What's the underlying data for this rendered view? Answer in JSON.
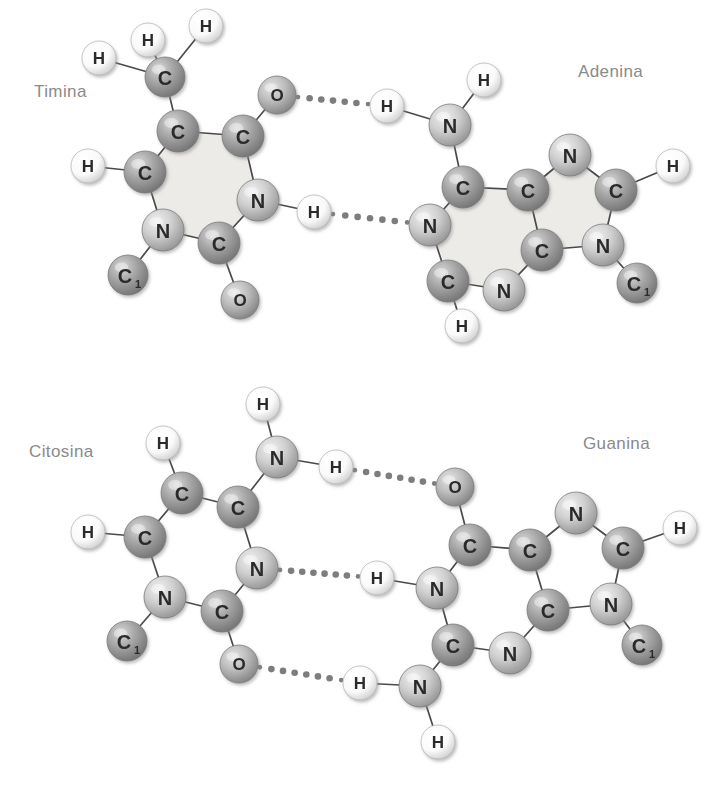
{
  "figure": {
    "title_present": false,
    "background_color": "#ffffff",
    "label_color": "#8a8a8a",
    "atom_text_color": "#2b2b2b",
    "colors": {
      "carbon_fill": "#9e9e9e",
      "nitrogen_fill": "#c9c9c9",
      "oxygen_fill": "#b4b4b4",
      "hydrogen_fill": "#fbfbfb",
      "ring_shade": "#eceae6",
      "bond_stroke": "#4a4a4a",
      "hbond_dot": "#7d7d7d"
    }
  },
  "labels": [
    {
      "id": "timina",
      "text": "Timina",
      "x": 34,
      "y": 90
    },
    {
      "id": "adenina",
      "text": "Adenina",
      "x": 578,
      "y": 70
    },
    {
      "id": "citosina",
      "text": "Citosina",
      "x": 29,
      "y": 450
    },
    {
      "id": "guanina",
      "text": "Guanina",
      "x": 583,
      "y": 442
    }
  ],
  "pairs": [
    {
      "id": "AT",
      "left_base": "Timina",
      "right_base": "Adenina",
      "hydrogen_bonds": 2
    },
    {
      "id": "CG",
      "left_base": "Citosina",
      "right_base": "Guanina",
      "hydrogen_bonds": 3
    }
  ],
  "rings": [
    {
      "id": "thymine-ring",
      "points": "178,131 243,136 258,200 219,243 163,230 145,172"
    },
    {
      "id": "adenine-ring6",
      "points": "463,187 528,190 542,250 505,290 450,279 430,225"
    },
    {
      "id": "adenine-ring5",
      "points": "528,190 570,155 615,190 603,245 542,250"
    }
  ],
  "atoms": [
    {
      "id": "t-ch3-h-left",
      "el": "H",
      "x": 99,
      "y": 58,
      "r": 17
    },
    {
      "id": "t-ch3-h-mid",
      "el": "H",
      "x": 148,
      "y": 40,
      "r": 17
    },
    {
      "id": "t-ch3-h-right",
      "el": "H",
      "x": 206,
      "y": 26,
      "r": 17
    },
    {
      "id": "t-ch3-c",
      "el": "C",
      "x": 165,
      "y": 77,
      "r": 20
    },
    {
      "id": "t-c5",
      "el": "C",
      "x": 178,
      "y": 131,
      "r": 21
    },
    {
      "id": "t-c4",
      "el": "C",
      "x": 243,
      "y": 136,
      "r": 21
    },
    {
      "id": "t-o4",
      "el": "O",
      "x": 277,
      "y": 95,
      "r": 19
    },
    {
      "id": "t-n3",
      "el": "N",
      "x": 258,
      "y": 200,
      "r": 21
    },
    {
      "id": "t-n3-h",
      "el": "H",
      "x": 314,
      "y": 212,
      "r": 17
    },
    {
      "id": "t-c2",
      "el": "C",
      "x": 219,
      "y": 243,
      "r": 21
    },
    {
      "id": "t-o2",
      "el": "O",
      "x": 240,
      "y": 300,
      "r": 19
    },
    {
      "id": "t-n1",
      "el": "N",
      "x": 163,
      "y": 230,
      "r": 21
    },
    {
      "id": "t-c1prime",
      "el": "C1",
      "x": 128,
      "y": 275,
      "r": 20
    },
    {
      "id": "t-c6",
      "el": "C",
      "x": 145,
      "y": 172,
      "r": 21
    },
    {
      "id": "t-c6-h",
      "el": "H",
      "x": 88,
      "y": 166,
      "r": 17
    },
    {
      "id": "a-n6",
      "el": "N",
      "x": 450,
      "y": 125,
      "r": 21
    },
    {
      "id": "a-n6-h-up",
      "el": "H",
      "x": 484,
      "y": 80,
      "r": 17
    },
    {
      "id": "a-n6-h-left",
      "el": "H",
      "x": 387,
      "y": 106,
      "r": 17
    },
    {
      "id": "a-c6",
      "el": "C",
      "x": 463,
      "y": 187,
      "r": 21
    },
    {
      "id": "a-n1",
      "el": "N",
      "x": 430,
      "y": 225,
      "r": 21
    },
    {
      "id": "a-c2",
      "el": "C",
      "x": 448,
      "y": 281,
      "r": 21
    },
    {
      "id": "a-c2-h",
      "el": "H",
      "x": 462,
      "y": 326,
      "r": 17
    },
    {
      "id": "a-n3",
      "el": "N",
      "x": 504,
      "y": 290,
      "r": 21
    },
    {
      "id": "a-c4",
      "el": "C",
      "x": 542,
      "y": 250,
      "r": 21
    },
    {
      "id": "a-c5",
      "el": "C",
      "x": 528,
      "y": 190,
      "r": 21
    },
    {
      "id": "a-n7",
      "el": "N",
      "x": 570,
      "y": 155,
      "r": 21
    },
    {
      "id": "a-c8",
      "el": "C",
      "x": 616,
      "y": 190,
      "r": 21
    },
    {
      "id": "a-c8-h",
      "el": "H",
      "x": 673,
      "y": 166,
      "r": 17
    },
    {
      "id": "a-n9",
      "el": "N",
      "x": 603,
      "y": 245,
      "r": 21
    },
    {
      "id": "a-c1prime",
      "el": "C1",
      "x": 637,
      "y": 283,
      "r": 20
    },
    {
      "id": "c-n4-h-up",
      "el": "H",
      "x": 263,
      "y": 404,
      "r": 17
    },
    {
      "id": "c-n4",
      "el": "N",
      "x": 277,
      "y": 457,
      "r": 21
    },
    {
      "id": "c-n4-h-right",
      "el": "H",
      "x": 336,
      "y": 467,
      "r": 17
    },
    {
      "id": "c-c5-h",
      "el": "H",
      "x": 163,
      "y": 443,
      "r": 17
    },
    {
      "id": "c-c5",
      "el": "C",
      "x": 182,
      "y": 493,
      "r": 21
    },
    {
      "id": "c-c4",
      "el": "C",
      "x": 238,
      "y": 507,
      "r": 21
    },
    {
      "id": "c-n3",
      "el": "N",
      "x": 257,
      "y": 568,
      "r": 21
    },
    {
      "id": "c-c2",
      "el": "C",
      "x": 222,
      "y": 611,
      "r": 21
    },
    {
      "id": "c-o2",
      "el": "O",
      "x": 239,
      "y": 664,
      "r": 19
    },
    {
      "id": "c-n1",
      "el": "N",
      "x": 165,
      "y": 597,
      "r": 21
    },
    {
      "id": "c-c1prime",
      "el": "C1",
      "x": 127,
      "y": 641,
      "r": 20
    },
    {
      "id": "c-c6",
      "el": "C",
      "x": 145,
      "y": 537,
      "r": 21
    },
    {
      "id": "c-c6-h",
      "el": "H",
      "x": 88,
      "y": 532,
      "r": 17
    },
    {
      "id": "g-o6",
      "el": "O",
      "x": 455,
      "y": 487,
      "r": 19
    },
    {
      "id": "g-c6",
      "el": "C",
      "x": 470,
      "y": 545,
      "r": 21
    },
    {
      "id": "g-n1",
      "el": "N",
      "x": 437,
      "y": 588,
      "r": 21
    },
    {
      "id": "g-n1-h",
      "el": "H",
      "x": 377,
      "y": 578,
      "r": 17
    },
    {
      "id": "g-c2",
      "el": "C",
      "x": 453,
      "y": 645,
      "r": 21
    },
    {
      "id": "g-n2",
      "el": "N",
      "x": 420,
      "y": 686,
      "r": 21
    },
    {
      "id": "g-n2-h-left",
      "el": "H",
      "x": 360,
      "y": 683,
      "r": 17
    },
    {
      "id": "g-n2-h-down",
      "el": "H",
      "x": 438,
      "y": 742,
      "r": 17
    },
    {
      "id": "g-n3",
      "el": "N",
      "x": 510,
      "y": 653,
      "r": 21
    },
    {
      "id": "g-c4",
      "el": "C",
      "x": 548,
      "y": 610,
      "r": 21
    },
    {
      "id": "g-c5",
      "el": "C",
      "x": 530,
      "y": 550,
      "r": 21
    },
    {
      "id": "g-n7",
      "el": "N",
      "x": 576,
      "y": 513,
      "r": 21
    },
    {
      "id": "g-c8",
      "el": "C",
      "x": 623,
      "y": 548,
      "r": 21
    },
    {
      "id": "g-c8-h",
      "el": "H",
      "x": 680,
      "y": 528,
      "r": 17
    },
    {
      "id": "g-n9",
      "el": "N",
      "x": 611,
      "y": 604,
      "r": 21
    },
    {
      "id": "g-c1prime",
      "el": "C1",
      "x": 642,
      "y": 645,
      "r": 20
    }
  ],
  "bonds": [
    [
      "t-ch3-h-left",
      "t-ch3-c"
    ],
    [
      "t-ch3-h-mid",
      "t-ch3-c"
    ],
    [
      "t-ch3-h-right",
      "t-ch3-c"
    ],
    [
      "t-ch3-c",
      "t-c5"
    ],
    [
      "t-c5",
      "t-c4"
    ],
    [
      "t-c4",
      "t-o4"
    ],
    [
      "t-c4",
      "t-n3"
    ],
    [
      "t-n3",
      "t-n3-h"
    ],
    [
      "t-n3",
      "t-c2"
    ],
    [
      "t-c2",
      "t-o2"
    ],
    [
      "t-c2",
      "t-n1"
    ],
    [
      "t-n1",
      "t-c1prime"
    ],
    [
      "t-n1",
      "t-c6"
    ],
    [
      "t-c6",
      "t-c5"
    ],
    [
      "t-c6",
      "t-c6-h"
    ],
    [
      "a-n6-h-up",
      "a-n6"
    ],
    [
      "a-n6-h-left",
      "a-n6"
    ],
    [
      "a-n6",
      "a-c6"
    ],
    [
      "a-c6",
      "a-n1"
    ],
    [
      "a-n1",
      "a-c2"
    ],
    [
      "a-c2",
      "a-c2-h"
    ],
    [
      "a-c2",
      "a-n3"
    ],
    [
      "a-n3",
      "a-c4"
    ],
    [
      "a-c4",
      "a-c5"
    ],
    [
      "a-c5",
      "a-c6"
    ],
    [
      "a-c5",
      "a-n7"
    ],
    [
      "a-n7",
      "a-c8"
    ],
    [
      "a-c8",
      "a-c8-h"
    ],
    [
      "a-c8",
      "a-n9"
    ],
    [
      "a-n9",
      "a-c4"
    ],
    [
      "a-n9",
      "a-c1prime"
    ],
    [
      "c-n4-h-up",
      "c-n4"
    ],
    [
      "c-n4",
      "c-n4-h-right"
    ],
    [
      "c-n4",
      "c-c4"
    ],
    [
      "c-c5-h",
      "c-c5"
    ],
    [
      "c-c5",
      "c-c4"
    ],
    [
      "c-c4",
      "c-n3"
    ],
    [
      "c-n3",
      "c-c2"
    ],
    [
      "c-c2",
      "c-o2"
    ],
    [
      "c-c2",
      "c-n1"
    ],
    [
      "c-n1",
      "c-c1prime"
    ],
    [
      "c-n1",
      "c-c6"
    ],
    [
      "c-c6",
      "c-c5"
    ],
    [
      "c-c6",
      "c-c6-h"
    ],
    [
      "g-o6",
      "g-c6"
    ],
    [
      "g-c6",
      "g-n1"
    ],
    [
      "g-n1",
      "g-n1-h"
    ],
    [
      "g-n1",
      "g-c2"
    ],
    [
      "g-c2",
      "g-n2"
    ],
    [
      "g-n2",
      "g-n2-h-left"
    ],
    [
      "g-n2",
      "g-n2-h-down"
    ],
    [
      "g-c2",
      "g-n3"
    ],
    [
      "g-n3",
      "g-c4"
    ],
    [
      "g-c4",
      "g-c5"
    ],
    [
      "g-c5",
      "g-c6"
    ],
    [
      "g-c5",
      "g-n7"
    ],
    [
      "g-n7",
      "g-c8"
    ],
    [
      "g-c8",
      "g-c8-h"
    ],
    [
      "g-c8",
      "g-n9"
    ],
    [
      "g-n9",
      "g-c4"
    ],
    [
      "g-n9",
      "g-c1prime"
    ]
  ],
  "hydrogen_bonds": [
    {
      "id": "hb-at-1",
      "from": "t-o4",
      "to": "a-n6-h-left",
      "dots": 6
    },
    {
      "id": "hb-at-2",
      "from": "t-n3-h",
      "to": "a-n1",
      "dots": 6
    },
    {
      "id": "hb-cg-1",
      "from": "c-n4-h-right",
      "to": "g-o6",
      "dots": 7
    },
    {
      "id": "hb-cg-2",
      "from": "c-n3",
      "to": "g-n1-h",
      "dots": 7
    },
    {
      "id": "hb-cg-3",
      "from": "c-o2",
      "to": "g-n2-h-left",
      "dots": 7
    }
  ]
}
